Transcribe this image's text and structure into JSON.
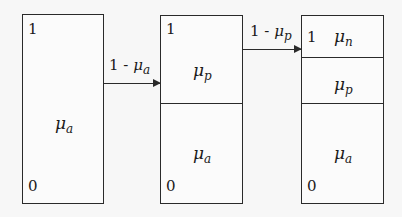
{
  "diagram": {
    "boxes": [
      {
        "top_label": "1",
        "bottom_label": "0",
        "regions": [
          {
            "symbol": "μ",
            "subscript": "a"
          }
        ]
      },
      {
        "top_label": "1",
        "bottom_label": "0",
        "regions": [
          {
            "symbol": "μ",
            "subscript": "p"
          },
          {
            "symbol": "μ",
            "subscript": "a"
          }
        ]
      },
      {
        "top_label": "1",
        "bottom_label": "0",
        "regions": [
          {
            "symbol": "μ",
            "subscript": "n"
          },
          {
            "symbol": "μ",
            "subscript": "p"
          },
          {
            "symbol": "μ",
            "subscript": "a"
          }
        ]
      }
    ],
    "arrows": [
      {
        "prefix": "1 - ",
        "symbol": "μ",
        "subscript": "a"
      },
      {
        "prefix": "1 - ",
        "symbol": "μ",
        "subscript": "p"
      }
    ]
  }
}
